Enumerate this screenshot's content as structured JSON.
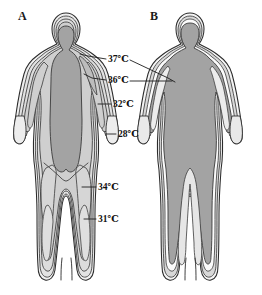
{
  "figure": {
    "background_color": "#ffffff",
    "width": 262,
    "height": 295
  },
  "panels": [
    {
      "id": "panel-a",
      "letter": "A",
      "condition": "cold environment",
      "letter_x": 18,
      "letter_y": 20
    },
    {
      "id": "panel-b",
      "letter": "B",
      "condition": "warm environment",
      "letter_x": 150,
      "letter_y": 20
    }
  ],
  "labels": [
    {
      "id": "label-37",
      "text": "37℃",
      "value": 37,
      "unit": "℃",
      "x": 108,
      "y": 62,
      "zone": "core"
    },
    {
      "id": "label-36",
      "text": "36℃",
      "value": 36,
      "unit": "℃",
      "x": 108,
      "y": 83,
      "zone": "inner-shell"
    },
    {
      "id": "label-32",
      "text": "32℃",
      "value": 32,
      "unit": "℃",
      "x": 113,
      "y": 107,
      "zone": "arm-shell"
    },
    {
      "id": "label-28",
      "text": "28℃",
      "value": 28,
      "unit": "℃",
      "x": 118,
      "y": 137,
      "zone": "hand-shell"
    },
    {
      "id": "label-34",
      "text": "34℃",
      "value": 34,
      "unit": "℃",
      "x": 98,
      "y": 190,
      "zone": "thigh-shell"
    },
    {
      "id": "label-31",
      "text": "31℃",
      "value": 31,
      "unit": "℃",
      "x": 98,
      "y": 222,
      "zone": "leg-shell"
    }
  ],
  "colors": {
    "core_dark": "#a3a3a3",
    "shell_mid": "#c9c9c9",
    "shell_light": "#e2e2e2",
    "shell_pale": "#efefef",
    "white": "#fbfbfb",
    "outline": "#2b2b2b",
    "text": "#111111",
    "background": "#ffffff"
  },
  "zones": {
    "legend": [
      {
        "temp": "37℃",
        "meaning": "body core"
      },
      {
        "temp": "36℃",
        "meaning": "inner shell"
      },
      {
        "temp": "34℃",
        "meaning": "thigh shell"
      },
      {
        "temp": "32℃",
        "meaning": "upper arm shell"
      },
      {
        "temp": "31℃",
        "meaning": "lower leg shell"
      },
      {
        "temp": "28℃",
        "meaning": "hand / extremity"
      }
    ]
  }
}
